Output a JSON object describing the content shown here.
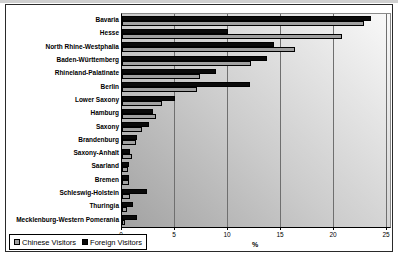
{
  "chart_data": {
    "type": "bar",
    "orientation": "horizontal",
    "title": "",
    "xlabel": "%",
    "xticks": [
      0,
      5,
      10,
      15,
      20,
      25
    ],
    "xlim": [
      0,
      25.3
    ],
    "grid": "vertical",
    "legend_position": "bottom-left",
    "plot_background": "gray gradient, dark bottom-left to light top-right",
    "categories": [
      "Bavaria",
      "Hesse",
      "North Rhine-Westphalia",
      "Baden-Württemberg",
      "Rhineland-Palatinate",
      "Berlin",
      "Lower Saxony",
      "Hamburg",
      "Saxony",
      "Brandenburg",
      "Saxony-Anhalt",
      "Saarland",
      "Bremen",
      "Schleswig-Holstein",
      "Thuringia",
      "Mecklenburg-Western Pomerania"
    ],
    "series": [
      {
        "name": "Chinese Visitors",
        "color": "#a0a0a0",
        "values": [
          22.8,
          20.8,
          16.3,
          12.2,
          7.4,
          7.1,
          3.8,
          3.2,
          1.9,
          1.3,
          0.9,
          0.6,
          0.7,
          0.8,
          0.5,
          0.3
        ]
      },
      {
        "name": "Foreign Visitors",
        "color": "#0a0a0a",
        "values": [
          23.5,
          10.0,
          14.3,
          13.7,
          8.9,
          12.1,
          5.0,
          2.9,
          2.5,
          1.4,
          0.8,
          0.7,
          0.7,
          2.4,
          1.0,
          1.4
        ]
      }
    ]
  },
  "colors": {
    "chart_border": "#2a2a2a",
    "gridline": "#6f6f6f",
    "plot_bg_dark": "#a2a2a2",
    "plot_bg_light": "#f9f9f9",
    "bar_border": "#000000"
  }
}
